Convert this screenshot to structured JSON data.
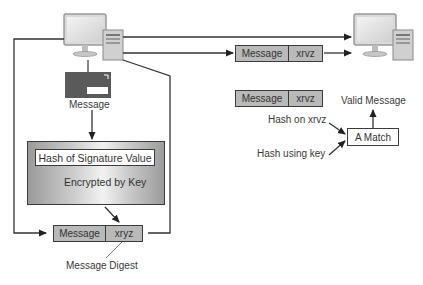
{
  "diagram": {
    "sender": {
      "icon": "desktop-computer-icon"
    },
    "receiver": {
      "icon": "desktop-computer-icon"
    },
    "envelope": {
      "icon": "envelope-icon",
      "label": "Message"
    },
    "signature_box": {
      "title": "Hash of Signature Value",
      "subtitle": "Encrypted by Key",
      "icon": "key-icon"
    },
    "sender_packet": {
      "left": "Message",
      "right": "xryz",
      "caption": "Message Digest"
    },
    "transmitted_packet": {
      "left": "Message",
      "right": "xrvz"
    },
    "received_packet": {
      "left": "Message",
      "right": "xrvz"
    },
    "verification": {
      "hash_on_label": "Hash on xrvz",
      "hash_key_label": "Hash using key",
      "match_label": "A Match",
      "result_label": "Valid Message"
    },
    "colors": {
      "envelope": "#5a5a5a",
      "packet_fill": "#b9b9b9",
      "line": "#333333"
    }
  }
}
